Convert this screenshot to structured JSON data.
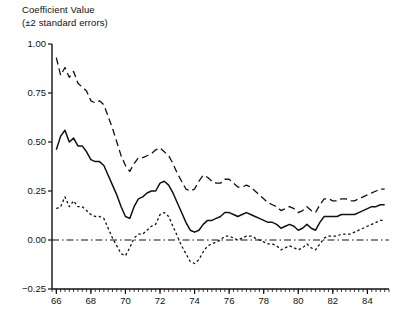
{
  "chart_data": {
    "type": "line",
    "title": "Coefficient Value\n(±2 standard errors)",
    "title_line1": "Coefficient Value",
    "title_line2": "(±2 standard errors)",
    "xlabel": "",
    "ylabel": "Coefficient Value",
    "xlim": [
      65.75,
      85.25
    ],
    "ylim": [
      -0.25,
      1.0
    ],
    "grid": false,
    "legend": false,
    "yticks": [
      "1.00",
      "0.75",
      "0.50",
      "0.25",
      "0.00",
      "−0.25"
    ],
    "ytick_values": [
      1.0,
      0.75,
      0.5,
      0.25,
      0.0,
      -0.25
    ],
    "xticks": [
      "66",
      "68",
      "70",
      "72",
      "74",
      "76",
      "78",
      "80",
      "82",
      "84"
    ],
    "xtick_values": [
      66,
      68,
      70,
      72,
      74,
      76,
      78,
      80,
      82,
      84
    ],
    "x_minor_step": 0.25,
    "zero_line": 0.0,
    "x": [
      66.0,
      66.25,
      66.5,
      66.75,
      67.0,
      67.25,
      67.5,
      67.75,
      68.0,
      68.25,
      68.5,
      68.75,
      69.0,
      69.25,
      69.5,
      69.75,
      70.0,
      70.25,
      70.5,
      70.75,
      71.0,
      71.25,
      71.5,
      71.75,
      72.0,
      72.25,
      72.5,
      72.75,
      73.0,
      73.25,
      73.5,
      73.75,
      74.0,
      74.25,
      74.5,
      74.75,
      75.0,
      75.25,
      75.5,
      75.75,
      76.0,
      76.25,
      76.5,
      76.75,
      77.0,
      77.25,
      77.5,
      77.75,
      78.0,
      78.25,
      78.5,
      78.75,
      79.0,
      79.25,
      79.5,
      79.75,
      80.0,
      80.25,
      80.5,
      80.75,
      81.0,
      81.25,
      81.5,
      81.75,
      82.0,
      82.25,
      82.5,
      82.75,
      83.0,
      83.25,
      83.5,
      83.75,
      84.0,
      84.25,
      84.5,
      84.75,
      85.0
    ],
    "series": [
      {
        "name": "upper 2 s.e. band",
        "style": "dashed",
        "values": [
          0.93,
          0.84,
          0.88,
          0.83,
          0.86,
          0.8,
          0.78,
          0.76,
          0.71,
          0.7,
          0.71,
          0.69,
          0.63,
          0.57,
          0.5,
          0.43,
          0.38,
          0.35,
          0.39,
          0.42,
          0.42,
          0.43,
          0.44,
          0.46,
          0.47,
          0.45,
          0.43,
          0.39,
          0.34,
          0.3,
          0.26,
          0.25,
          0.26,
          0.3,
          0.33,
          0.32,
          0.3,
          0.29,
          0.29,
          0.31,
          0.31,
          0.29,
          0.27,
          0.27,
          0.28,
          0.27,
          0.25,
          0.23,
          0.21,
          0.19,
          0.18,
          0.17,
          0.15,
          0.16,
          0.17,
          0.16,
          0.14,
          0.15,
          0.17,
          0.15,
          0.14,
          0.18,
          0.21,
          0.21,
          0.2,
          0.2,
          0.21,
          0.21,
          0.2,
          0.2,
          0.21,
          0.22,
          0.23,
          0.24,
          0.25,
          0.26,
          0.26
        ]
      },
      {
        "name": "coefficient estimate",
        "style": "solid",
        "values": [
          0.46,
          0.53,
          0.56,
          0.5,
          0.52,
          0.48,
          0.48,
          0.45,
          0.41,
          0.4,
          0.4,
          0.38,
          0.33,
          0.28,
          0.23,
          0.17,
          0.12,
          0.11,
          0.17,
          0.21,
          0.22,
          0.24,
          0.25,
          0.25,
          0.29,
          0.3,
          0.28,
          0.24,
          0.19,
          0.14,
          0.09,
          0.05,
          0.04,
          0.05,
          0.08,
          0.1,
          0.1,
          0.11,
          0.12,
          0.14,
          0.14,
          0.13,
          0.12,
          0.13,
          0.14,
          0.13,
          0.12,
          0.11,
          0.1,
          0.09,
          0.09,
          0.08,
          0.06,
          0.07,
          0.08,
          0.07,
          0.05,
          0.06,
          0.08,
          0.06,
          0.05,
          0.09,
          0.12,
          0.12,
          0.12,
          0.12,
          0.13,
          0.13,
          0.13,
          0.13,
          0.14,
          0.15,
          0.16,
          0.17,
          0.17,
          0.18,
          0.18
        ]
      },
      {
        "name": "lower 2 s.e. band",
        "style": "dotted",
        "values": [
          0.16,
          0.17,
          0.22,
          0.17,
          0.2,
          0.17,
          0.17,
          0.15,
          0.13,
          0.12,
          0.12,
          0.11,
          0.06,
          0.01,
          -0.03,
          -0.07,
          -0.08,
          -0.04,
          0.01,
          0.03,
          0.03,
          0.05,
          0.07,
          0.08,
          0.13,
          0.14,
          0.12,
          0.07,
          0.02,
          -0.03,
          -0.07,
          -0.11,
          -0.12,
          -0.1,
          -0.06,
          -0.03,
          -0.02,
          -0.01,
          0.0,
          0.02,
          0.02,
          0.01,
          0.0,
          0.01,
          0.02,
          0.02,
          0.01,
          0.0,
          -0.01,
          -0.02,
          -0.02,
          -0.03,
          -0.05,
          -0.04,
          -0.03,
          -0.04,
          -0.05,
          -0.04,
          -0.02,
          -0.04,
          -0.05,
          -0.02,
          0.01,
          0.02,
          0.02,
          0.02,
          0.03,
          0.03,
          0.03,
          0.04,
          0.05,
          0.06,
          0.07,
          0.08,
          0.09,
          0.1,
          0.1
        ]
      }
    ]
  }
}
